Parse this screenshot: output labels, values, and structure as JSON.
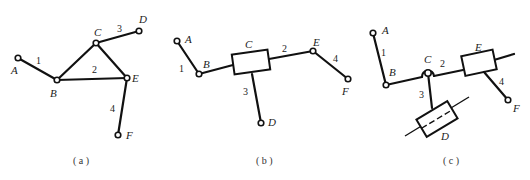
{
  "figures": [
    {
      "id": "a",
      "caption": "( a )",
      "points": {
        "A": "A",
        "B": "B",
        "C": "C",
        "D": "D",
        "E": "E",
        "F": "F"
      },
      "links": {
        "l1": "1",
        "l2": "2",
        "l3": "3",
        "l4": "4"
      }
    },
    {
      "id": "b",
      "caption": "( b )",
      "points": {
        "A": "A",
        "B": "B",
        "C": "C",
        "D": "D",
        "E": "E",
        "F": "F"
      },
      "links": {
        "l1": "1",
        "l2": "2",
        "l3": "3",
        "l4": "4"
      }
    },
    {
      "id": "c",
      "caption": "( c )",
      "points": {
        "A": "A",
        "B": "B",
        "C": "C",
        "D": "D",
        "E": "E",
        "F": "F"
      },
      "links": {
        "l1": "1",
        "l2": "2",
        "l3": "3",
        "l4": "4"
      }
    }
  ]
}
